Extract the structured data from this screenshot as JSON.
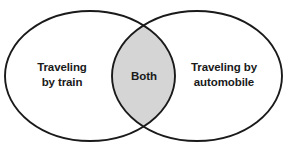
{
  "diagram": {
    "type": "venn-diagram",
    "sets": 2,
    "background_color": "#ffffff",
    "stroke_color": "#1a1a1a",
    "overlap_fill_color": "#d5d5d5",
    "left_set": {
      "name": "traveling-by-train",
      "label_line1": "Traveling",
      "label_line2": "by train",
      "fill_color": "#ffffff"
    },
    "right_set": {
      "name": "traveling-by-automobile",
      "label_line1": "Traveling by",
      "label_line2": "automobile",
      "fill_color": "#ffffff"
    },
    "intersection": {
      "name": "both",
      "label": "Both",
      "fill_color": "#d5d5d5"
    }
  }
}
